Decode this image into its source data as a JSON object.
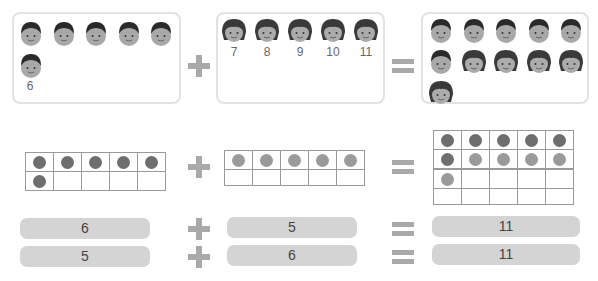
{
  "operators": {
    "plus": "+",
    "equals": "="
  },
  "colors": {
    "frame_border": "#e2e2e2",
    "operator": "#a9a9a9",
    "dot_dark": "#6e6e6e",
    "dot_light": "#9a9a9a",
    "pill": "#d4d4d4"
  },
  "row1": {
    "group_a": {
      "kind": "boy-face-icon",
      "count": 6,
      "label": "6"
    },
    "group_b": {
      "kind": "girl-face-icon",
      "count": 5,
      "labels": [
        "7",
        "8",
        "9",
        "10",
        "11"
      ]
    },
    "result": {
      "boys": 6,
      "girls": 5,
      "total": 11
    }
  },
  "row2": {
    "frame_a": {
      "filled": 6,
      "color": "dark"
    },
    "frame_b": {
      "filled": 5,
      "color": "light"
    },
    "result": {
      "frame1_dark": 6,
      "frame1_light": 4,
      "frame2_light": 1
    }
  },
  "equations": [
    {
      "a": "6",
      "b": "5",
      "sum": "11"
    },
    {
      "a": "5",
      "b": "6",
      "sum": "11"
    }
  ]
}
